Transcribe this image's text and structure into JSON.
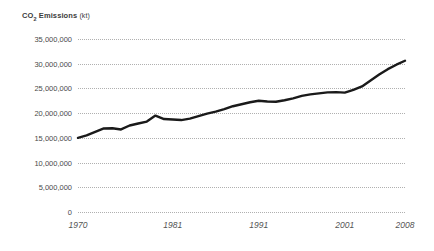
{
  "chart_data": {
    "type": "line",
    "title_main": "CO",
    "title_sub": "2",
    "title_rest": " Emissions",
    "title_unit": "(kt)",
    "xlabel": "",
    "ylabel": "",
    "grid": true,
    "legend": "none",
    "line_color": "#1a1a1a",
    "grid_color": "#b0b0b0",
    "background_color": "#ffffff",
    "text_color": "#4a4a4a",
    "xlim": [
      1970,
      2008
    ],
    "ylim": [
      0,
      35000000
    ],
    "ytick_labels": [
      "35,000,000",
      "30,000,000",
      "25,000,000",
      "20,000,000",
      "15,000,000",
      "10,000,000",
      "5,000,000",
      "0"
    ],
    "ytick_values": [
      35000000,
      30000000,
      25000000,
      20000000,
      15000000,
      10000000,
      5000000,
      0
    ],
    "xtick_labels": [
      "1970",
      "1981",
      "1991",
      "2001",
      "2008"
    ],
    "xtick_values": [
      1970,
      1981,
      1991,
      2001,
      2008
    ],
    "x": [
      1970,
      1971,
      1972,
      1973,
      1974,
      1975,
      1976,
      1977,
      1978,
      1979,
      1980,
      1981,
      1982,
      1983,
      1984,
      1985,
      1986,
      1987,
      1988,
      1989,
      1990,
      1991,
      1992,
      1993,
      1994,
      1995,
      1996,
      1997,
      1998,
      1999,
      2000,
      2001,
      2002,
      2003,
      2004,
      2005,
      2006,
      2007,
      2008
    ],
    "values": [
      15000000,
      15500000,
      16200000,
      16900000,
      16950000,
      16700000,
      17500000,
      17900000,
      18300000,
      19500000,
      18800000,
      18700000,
      18600000,
      18900000,
      19400000,
      19900000,
      20300000,
      20800000,
      21400000,
      21800000,
      22200000,
      22500000,
      22350000,
      22300000,
      22600000,
      23000000,
      23500000,
      23800000,
      24000000,
      24200000,
      24250000,
      24150000,
      24700000,
      25400000,
      26600000,
      27800000,
      28900000,
      29800000,
      30600000
    ],
    "series_name": "CO2 Emissions"
  }
}
